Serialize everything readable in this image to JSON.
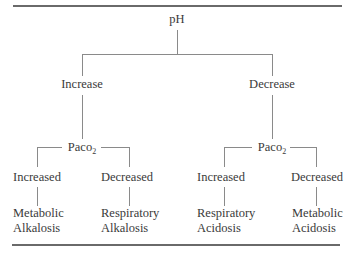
{
  "diagram": {
    "root": "pH",
    "branches": [
      {
        "label": "Increase",
        "node": {
          "prefix": "Paco",
          "subscript": "2"
        },
        "children": [
          {
            "label": "Increased",
            "result_line1": "Metabolic",
            "result_line2": "Alkalosis"
          },
          {
            "label": "Decreased",
            "result_line1": "Respiratory",
            "result_line2": "Alkalosis"
          }
        ]
      },
      {
        "label": "Decrease",
        "node": {
          "prefix": "Paco",
          "subscript": "2"
        },
        "children": [
          {
            "label": "Increased",
            "result_line1": "Respiratory",
            "result_line2": "Acidosis"
          },
          {
            "label": "Decreased",
            "result_line1": "Metabolic",
            "result_line2": "Acidosis"
          }
        ]
      }
    ],
    "colors": {
      "text": "#3a3a3a",
      "lines": "#8a8a8a",
      "rules": "#6a6a6a"
    }
  }
}
